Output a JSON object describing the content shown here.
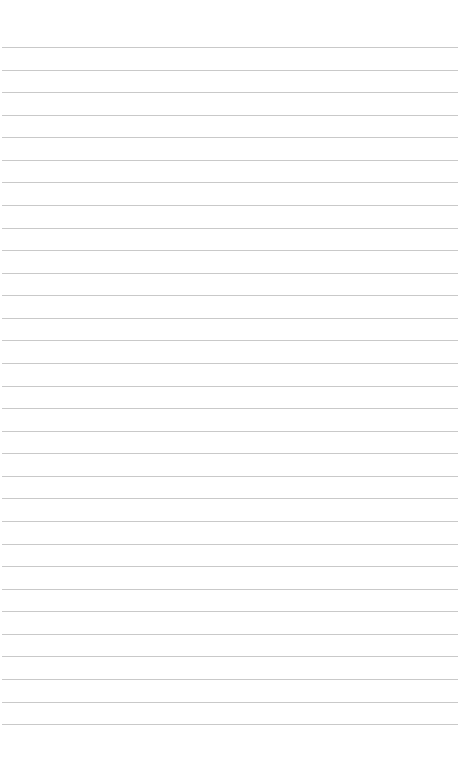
{
  "page": {
    "type": "lined-paper",
    "background": "#ffffff",
    "rule_color": "#c9c9c9",
    "rule_count": 31,
    "first_rule_y": 47,
    "rule_spacing": 22.57
  }
}
